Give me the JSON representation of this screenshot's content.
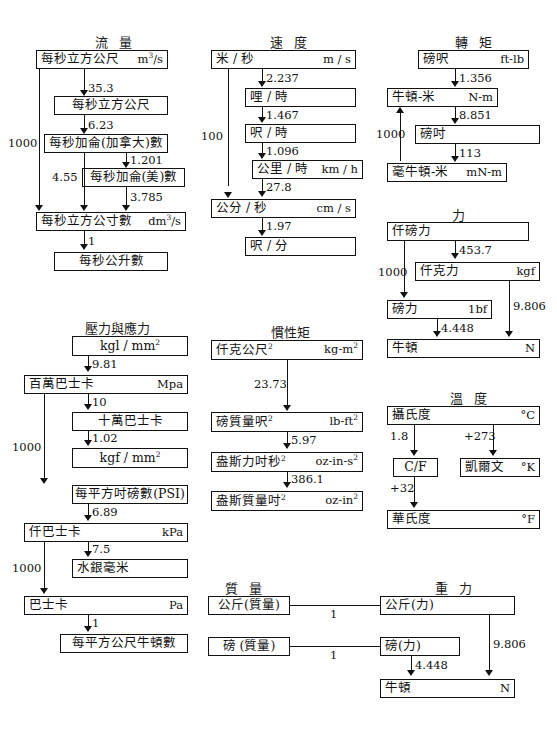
{
  "document": {
    "title": "單位換算流程圖",
    "sections": [
      {
        "id": "flow",
        "heading": "流 量",
        "boxes": [
          {
            "name": "cubic-metre-per-second",
            "cn": "每秒立方公尺",
            "unit": "m3/s"
          },
          {
            "name": "cubic-foot-per-second",
            "cn": "每秒立方公尺",
            "unit": ""
          },
          {
            "name": "gallon-canada-per-second",
            "cn": "每秒加侖(加拿大)數",
            "unit": ""
          },
          {
            "name": "gallon-us-per-second",
            "cn": "每秒加侖(美)數",
            "unit": ""
          },
          {
            "name": "cubic-decimetre-per-second",
            "cn": "每秒立方公寸數",
            "unit": "dm3/s"
          },
          {
            "name": "litre-per-second",
            "cn": "每秒公升數",
            "unit": ""
          }
        ],
        "factors": [
          "35.3",
          "6.23",
          "1.201",
          "3.785",
          "1",
          "1000",
          "4.55"
        ]
      },
      {
        "id": "speed",
        "heading": "速 度",
        "boxes": [
          {
            "name": "metre-per-second",
            "cn": "米 / 秒",
            "unit": "m / s"
          },
          {
            "name": "mile-per-hour",
            "cn": "哩 / 時",
            "unit": ""
          },
          {
            "name": "foot-per-hour",
            "cn": "呎 / 時",
            "unit": ""
          },
          {
            "name": "kilometre-per-hour",
            "cn": "公里 / 時",
            "unit": "km / h"
          },
          {
            "name": "centimetre-per-second",
            "cn": "公分 / 秒",
            "unit": "cm / s"
          },
          {
            "name": "foot-per-minute",
            "cn": "呎 / 分",
            "unit": ""
          }
        ],
        "factors": [
          "2.237",
          "1.467",
          "1.096",
          "27.8",
          "1.97",
          "100"
        ]
      },
      {
        "id": "torque",
        "heading": "轉 矩",
        "boxes": [
          {
            "name": "foot-pound",
            "cn": "磅呎",
            "unit": "ft-lb"
          },
          {
            "name": "newton-metre",
            "cn": "牛頓-米",
            "unit": "N-m"
          },
          {
            "name": "pound-inch",
            "cn": "磅吋",
            "unit": ""
          },
          {
            "name": "millinewton-metre",
            "cn": "毫牛頓-米",
            "unit": "mN-m"
          }
        ],
        "factors": [
          "1.356",
          "8.851",
          "113",
          "1000"
        ]
      },
      {
        "id": "force",
        "heading": "力",
        "boxes": [
          {
            "name": "kilopound-force",
            "cn": "仟磅力",
            "unit": ""
          },
          {
            "name": "kilogram-force",
            "cn": "仟克力",
            "unit": "kgf"
          },
          {
            "name": "pound-force",
            "cn": "磅力",
            "unit": "1bf"
          },
          {
            "name": "newton",
            "cn": "牛頓",
            "unit": "N"
          }
        ],
        "factors": [
          "453.7",
          "4.448",
          "9.806",
          "1000"
        ]
      },
      {
        "id": "pressure",
        "heading": "壓力與應力",
        "boxes": [
          {
            "name": "kgl-per-mm2",
            "cn": "kgl / mm2",
            "unit": ""
          },
          {
            "name": "megapascal",
            "cn": "百萬巴士卡",
            "unit": "Mpa"
          },
          {
            "name": "hundred-thousand-bar",
            "cn": "十萬巴士卡",
            "unit": ""
          },
          {
            "name": "kgf-per-mm2",
            "cn": "kgf / mm2",
            "unit": ""
          },
          {
            "name": "psi",
            "cn": "每平方吋磅數(PSI)",
            "unit": ""
          },
          {
            "name": "kilopascal",
            "cn": "仟巴士卡",
            "unit": "kPa"
          },
          {
            "name": "millimetre-mercury",
            "cn": "水銀毫米",
            "unit": ""
          },
          {
            "name": "pascal",
            "cn": "巴士卡",
            "unit": "Pa"
          },
          {
            "name": "newton-per-square-metre",
            "cn": "每平方公尺牛頓數",
            "unit": ""
          }
        ],
        "factors": [
          "9.81",
          "10",
          "1.02",
          "6.89",
          "7.5",
          "1",
          "1000",
          "1000"
        ]
      },
      {
        "id": "inertia",
        "heading": "慣性矩",
        "boxes": [
          {
            "name": "kilogram-metre-squared",
            "cn": "仟克公尺2",
            "unit": "kg-m2"
          },
          {
            "name": "pound-mass-foot-squared",
            "cn": "磅質量呎2",
            "unit": "lb-ft2"
          },
          {
            "name": "ounce-force-inch-second-squared",
            "cn": "盎斯力吋秒2",
            "unit": "oz-in-s2"
          },
          {
            "name": "ounce-mass-inch-squared",
            "cn": "盎斯質量吋2",
            "unit": "oz-in2"
          }
        ],
        "factors": [
          "23.73",
          "5.97",
          "386.1"
        ]
      },
      {
        "id": "temperature",
        "heading": "溫 度",
        "boxes": [
          {
            "name": "celsius",
            "cn": "攝氏度",
            "unit": "°C"
          },
          {
            "name": "c-over-f",
            "cn": "C/F",
            "unit": ""
          },
          {
            "name": "kelvin",
            "cn": "凱爾文",
            "unit": "°K"
          },
          {
            "name": "fahrenheit",
            "cn": "華氏度",
            "unit": "°F"
          }
        ],
        "factors": [
          "1.8",
          "+273",
          "+32"
        ]
      },
      {
        "id": "mass",
        "heading": "質 量",
        "boxes": [
          {
            "name": "kilogram-mass",
            "cn": "公斤(質量)",
            "unit": ""
          },
          {
            "name": "pound-mass",
            "cn": "磅 (質量)",
            "unit": ""
          }
        ],
        "factors": [
          "1",
          "1"
        ]
      },
      {
        "id": "gravity",
        "heading": "重 力",
        "boxes": [
          {
            "name": "kilogram-force-weight",
            "cn": "公斤(力)",
            "unit": ""
          },
          {
            "name": "pound-force-weight",
            "cn": "磅(力)",
            "unit": ""
          },
          {
            "name": "newton-weight",
            "cn": "牛頓",
            "unit": "N"
          }
        ],
        "factors": [
          "4.448",
          "9.806"
        ]
      }
    ]
  }
}
